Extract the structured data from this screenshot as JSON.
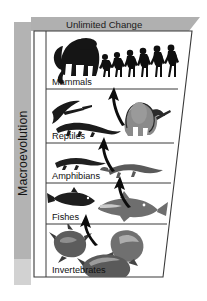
{
  "figure": {
    "type": "diagram",
    "banner": {
      "label": "Unlimited Change",
      "shape": "parallelogram",
      "color": "#b0b0b0"
    },
    "side_axis": {
      "label": "Macroevolution",
      "orientation": "vertical-rotated-ccw",
      "color": "#b3b3b3",
      "foot_color": "#d2d2d2"
    },
    "frame": {
      "shape": "trapezoid",
      "note": "wide at top, narrowing toward the bottom",
      "border_color": "#3a3a3a",
      "fill": "#ffffff"
    },
    "arrow_color": "#101010",
    "tiers": [
      {
        "label": "Mammals",
        "order": 5,
        "organisms": [
          "mammoth",
          "hominid-progression"
        ],
        "hominid_figure_count": 6
      },
      {
        "label": "Reptiles",
        "order": 4,
        "organisms": [
          "pterosaur",
          "crocodilian",
          "sail-backed-dimetrodon"
        ]
      },
      {
        "label": "Amphibians",
        "order": 3,
        "organisms": [
          "salamander",
          "newt"
        ]
      },
      {
        "label": "Fishes",
        "order": 2,
        "organisms": [
          "trout",
          "tuna"
        ]
      },
      {
        "label": "Invertebrates",
        "order": 1,
        "organisms": [
          "spiny-shell",
          "conch-shell",
          "clam-shell"
        ]
      }
    ]
  }
}
